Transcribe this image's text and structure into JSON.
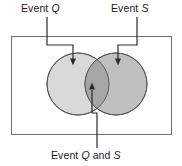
{
  "diagram": {
    "type": "venn-diagram",
    "universe_rect": {
      "x": 11,
      "y": 36,
      "width": 161,
      "height": 99,
      "stroke": "#6e6e6e",
      "fill": "#ffffff"
    },
    "sets": [
      {
        "key": "q",
        "label": "Event ",
        "label_italic": "Q",
        "cx": 78,
        "cy": 84,
        "r": 31,
        "fill": "#d9d9d9",
        "stroke": "#5a5a5a"
      },
      {
        "key": "s",
        "label": "Event ",
        "label_italic": "S",
        "cx": 116,
        "cy": 84,
        "r": 31,
        "fill": "#bfbfbf",
        "stroke": "#5a5a5a"
      }
    ],
    "intersection": {
      "label_prefix": "Event ",
      "label_italic_1": "Q",
      "label_mid": " and ",
      "label_italic_2": "S",
      "fill": "#a6a6a6",
      "stroke": "#5a5a5a"
    },
    "leaders": [
      {
        "name": "leader-event-q",
        "path": "M 47 17 L 47 45 L 73 45 L 73 59",
        "arrow_tip": {
          "x": 73,
          "y": 65
        },
        "arrow_direction": "down"
      },
      {
        "name": "leader-event-s",
        "path": "M 137 17 L 137 45 L 118 45 L 118 59",
        "arrow_tip": {
          "x": 118,
          "y": 65
        },
        "arrow_direction": "down"
      },
      {
        "name": "leader-event-q-and-s",
        "path": "M 97 148 L 97 113 L 92 113 L 92 90",
        "arrow_tip": {
          "x": 92,
          "y": 83
        },
        "arrow_direction": "up"
      }
    ],
    "line_color": "#2b2b2b"
  },
  "labels": {
    "event_q": {
      "prefix": "Event ",
      "italic": "Q"
    },
    "event_s": {
      "prefix": "Event ",
      "italic": "S"
    },
    "event_q_and_s": {
      "prefix": "Event ",
      "italic_1": "Q",
      "mid": " and ",
      "italic_2": "S"
    }
  }
}
